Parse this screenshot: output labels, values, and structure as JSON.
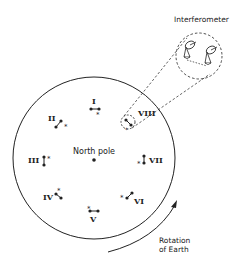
{
  "title": "Interferometer",
  "pole_label": "North pole",
  "rotation_label_line1": "Rotation",
  "rotation_label_line2": "of Earth",
  "stations": [
    {
      "id": "I",
      "label": "I"
    },
    {
      "id": "II",
      "label": "II"
    },
    {
      "id": "III",
      "label": "III"
    },
    {
      "id": "IV",
      "label": "IV"
    },
    {
      "id": "V",
      "label": "V"
    },
    {
      "id": "VI",
      "label": "VI"
    },
    {
      "id": "VII",
      "label": "VII"
    },
    {
      "id": "VIII",
      "label": "VIII"
    }
  ],
  "colors": {
    "ink": "#222222",
    "background": "#ffffff"
  }
}
